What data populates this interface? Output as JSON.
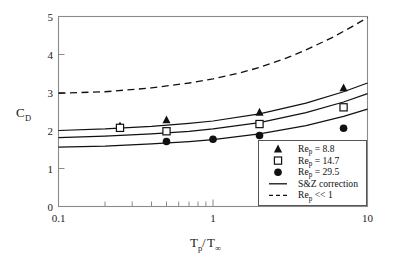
{
  "chart_data": {
    "type": "scatter",
    "title": "",
    "xlabel": "Tp/T∞",
    "xlabel_parts": {
      "base1": "T",
      "sub1": "p",
      "slash": "/",
      "base2": "T",
      "sub2": "∞"
    },
    "ylabel": "CD",
    "ylabel_parts": {
      "base": "C",
      "sub": "D"
    },
    "xscale": "log",
    "yscale": "linear",
    "xlim": [
      0.1,
      10
    ],
    "ylim": [
      0,
      5
    ],
    "xticks": [
      0.1,
      1,
      10
    ],
    "xticklabels": [
      "0.1",
      "1",
      "10"
    ],
    "yticks": [
      0,
      1,
      2,
      3,
      4,
      5
    ],
    "yticklabels": [
      "0",
      "1",
      "2",
      "3",
      "4",
      "5"
    ],
    "grid": false,
    "legend_position": "lower-right-inside",
    "series": [
      {
        "name": "Rep = 8.8",
        "label_base": "Re",
        "label_sub": "p",
        "label_rest": " = 8.8",
        "marker": "filled-triangle",
        "type": "scatter",
        "x": [
          0.25,
          0.5,
          2.0,
          7.0
        ],
        "y": [
          2.12,
          2.28,
          2.48,
          3.12
        ]
      },
      {
        "name": "Rep = 14.7",
        "label_base": "Re",
        "label_sub": "p",
        "label_rest": " = 14.7",
        "marker": "open-square",
        "type": "scatter",
        "x": [
          0.25,
          0.5,
          2.0,
          7.0
        ],
        "y": [
          2.07,
          1.98,
          2.17,
          2.61
        ]
      },
      {
        "name": "Rep = 29.5",
        "label_base": "Re",
        "label_sub": "p",
        "label_rest": " = 29.5",
        "marker": "filled-circle",
        "type": "scatter",
        "x": [
          0.5,
          1.0,
          2.0,
          7.0
        ],
        "y": [
          1.71,
          1.77,
          1.87,
          2.06
        ]
      },
      {
        "name": "S&Z correction",
        "label_base": "S&Z correction",
        "label_sub": "",
        "label_rest": "",
        "marker": "solid-line",
        "type": "line",
        "comment": "three solid correction curves, one per Rep value",
        "curves": [
          {
            "for": "Rep = 8.8",
            "x": [
              0.1,
              0.2,
              0.4,
              0.7,
              1.0,
              2.0,
              4.0,
              7.0,
              10.0
            ],
            "y": [
              2.0,
              2.04,
              2.11,
              2.19,
              2.25,
              2.44,
              2.72,
              3.02,
              3.25
            ]
          },
          {
            "for": "Rep = 14.7",
            "x": [
              0.1,
              0.2,
              0.4,
              0.7,
              1.0,
              2.0,
              4.0,
              7.0,
              10.0
            ],
            "y": [
              1.81,
              1.85,
              1.91,
              1.98,
              2.04,
              2.21,
              2.47,
              2.75,
              2.97
            ]
          },
          {
            "for": "Rep = 29.5",
            "x": [
              0.1,
              0.2,
              0.4,
              0.7,
              1.0,
              2.0,
              4.0,
              7.0,
              10.0
            ],
            "y": [
              1.56,
              1.59,
              1.65,
              1.71,
              1.76,
              1.91,
              2.13,
              2.37,
              2.56
            ]
          }
        ]
      },
      {
        "name": "Rep << 1",
        "label_base": "Re",
        "label_sub": "p",
        "label_rest": " << 1",
        "marker": "dashed-line",
        "type": "line",
        "x": [
          0.1,
          0.2,
          0.4,
          0.7,
          1.0,
          1.5,
          2.0,
          3.0,
          4.0,
          6.0,
          8.0,
          10.0
        ],
        "y": [
          2.98,
          3.02,
          3.12,
          3.25,
          3.36,
          3.52,
          3.66,
          3.91,
          4.12,
          4.46,
          4.74,
          4.97
        ]
      }
    ],
    "legend_entries": [
      {
        "marker": "filled-triangle",
        "base": "Re",
        "sub": "p",
        "rest": " = 8.8"
      },
      {
        "marker": "open-square",
        "base": "Re",
        "sub": "p",
        "rest": " = 14.7"
      },
      {
        "marker": "filled-circle",
        "base": "Re",
        "sub": "p",
        "rest": " = 29.5"
      },
      {
        "marker": "solid-line",
        "base": "S&Z correction",
        "sub": "",
        "rest": ""
      },
      {
        "marker": "dashed-line",
        "base": "Re",
        "sub": "p",
        "rest": " << 1"
      }
    ],
    "colors": {
      "data": "#111111",
      "axis": "#8a8a8a",
      "background": "#ffffff",
      "legend_border": "#555555"
    }
  }
}
